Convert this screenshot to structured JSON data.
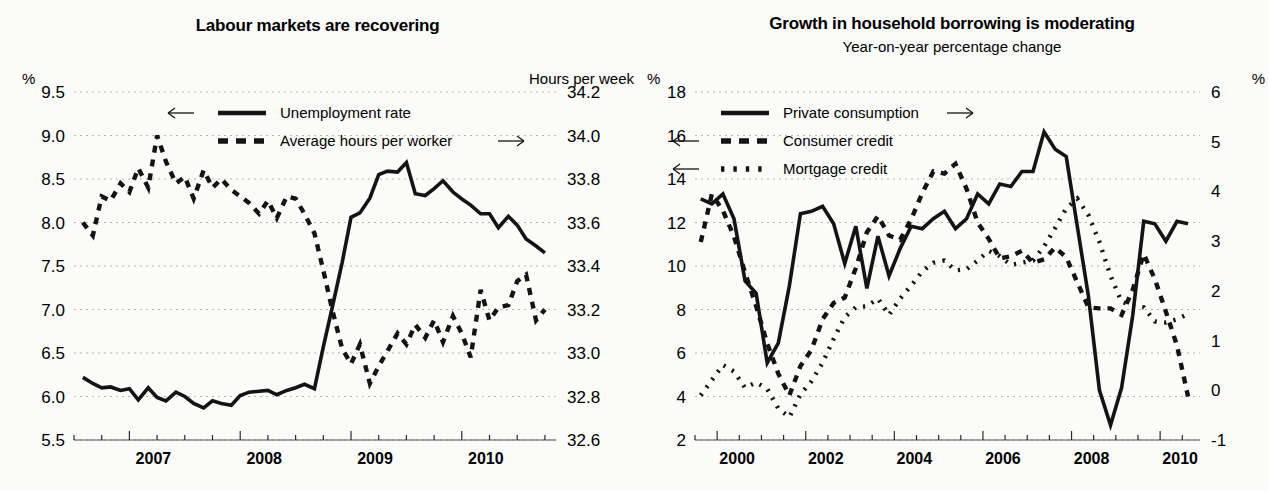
{
  "figure": {
    "background_color": "#fbfbfa",
    "ink_color": "#141414",
    "grid_color": "#b9b2ad"
  },
  "panels": [
    {
      "id": "labour-markets",
      "title": "Labour markets are recovering",
      "subtitle": "",
      "left_axis_unit": "%",
      "right_axis_unit": "Hours per week",
      "legend": [
        {
          "label": "Unemployment rate",
          "style": "solid",
          "arrow": "left"
        },
        {
          "label": "Average hours per worker",
          "style": "dashed",
          "arrow": "right"
        }
      ]
    },
    {
      "id": "household-borrowing",
      "title": "Growth in household borrowing is moderating",
      "subtitle": "Year-on-year percentage change",
      "left_axis_unit": "%",
      "right_axis_unit": "%",
      "legend": [
        {
          "label": "Private consumption",
          "style": "solid",
          "arrow": "right"
        },
        {
          "label": "Consumer credit",
          "style": "dashed",
          "arrow": "left"
        },
        {
          "label": "Mortgage credit",
          "style": "dotted",
          "arrow": "left"
        }
      ]
    }
  ],
  "chart_data": [
    {
      "type": "line",
      "id": "labour-markets",
      "title": "Labour markets are recovering",
      "subtitle": "",
      "xlabel": "",
      "ylabel": "%",
      "y2label": "Hours per week",
      "grid": true,
      "legend_position": "top-center",
      "xlim": [
        2006.5,
        2010.85
      ],
      "xticks_major": [
        2007,
        2008,
        2009,
        2010
      ],
      "xtick_labels": [
        "2007",
        "2008",
        "2009",
        "2010"
      ],
      "xtick_minor_step": 0.25,
      "ylim": [
        5.5,
        9.5
      ],
      "yticks": [
        5.5,
        6.0,
        6.5,
        7.0,
        7.5,
        8.0,
        8.5,
        9.0,
        9.5
      ],
      "ytick_labels": [
        "5.5",
        "6.0",
        "6.5",
        "7.0",
        "7.5",
        "8.0",
        "8.5",
        "9.0",
        "9.5"
      ],
      "y2lim": [
        32.6,
        34.2
      ],
      "y2ticks": [
        32.6,
        32.8,
        33.0,
        33.2,
        33.4,
        33.6,
        33.8,
        34.0,
        34.2
      ],
      "y2tick_labels": [
        "32.6",
        "32.8",
        "33.0",
        "33.2",
        "33.4",
        "33.6",
        "33.8",
        "34.0",
        "34.2"
      ],
      "series": [
        {
          "name": "Unemployment rate",
          "style": "solid",
          "axis": "left",
          "x": [
            2006.58,
            2006.67,
            2006.75,
            2006.83,
            2006.92,
            2007.0,
            2007.08,
            2007.17,
            2007.25,
            2007.33,
            2007.42,
            2007.5,
            2007.58,
            2007.67,
            2007.75,
            2007.83,
            2007.92,
            2008.0,
            2008.08,
            2008.17,
            2008.25,
            2008.33,
            2008.42,
            2008.5,
            2008.58,
            2008.67,
            2008.75,
            2008.83,
            2008.92,
            2009.0,
            2009.08,
            2009.17,
            2009.25,
            2009.33,
            2009.42,
            2009.5,
            2009.58,
            2009.67,
            2009.75,
            2009.83,
            2009.92,
            2010.0,
            2010.08,
            2010.17,
            2010.25,
            2010.33,
            2010.42,
            2010.5,
            2010.58,
            2010.67,
            2010.75
          ],
          "y": [
            6.22,
            6.15,
            6.1,
            6.11,
            6.07,
            6.09,
            5.96,
            6.1,
            5.99,
            5.95,
            6.05,
            6.0,
            5.92,
            5.87,
            5.95,
            5.92,
            5.9,
            6.01,
            6.05,
            6.06,
            6.07,
            6.02,
            6.07,
            6.1,
            6.14,
            6.09,
            6.57,
            7.02,
            7.54,
            8.06,
            8.11,
            8.28,
            8.55,
            8.59,
            8.58,
            8.69,
            8.33,
            8.31,
            8.39,
            8.48,
            8.35,
            8.27,
            8.2,
            8.1,
            8.1,
            7.94,
            8.07,
            7.97,
            7.81,
            7.73,
            7.65,
            7.62
          ]
        },
        {
          "name": "Average hours per worker",
          "style": "dashed",
          "axis": "right",
          "x": [
            2006.58,
            2006.67,
            2006.75,
            2006.83,
            2006.92,
            2007.0,
            2007.08,
            2007.17,
            2007.25,
            2007.33,
            2007.42,
            2007.5,
            2007.58,
            2007.67,
            2007.75,
            2007.83,
            2007.92,
            2008.0,
            2008.08,
            2008.17,
            2008.25,
            2008.33,
            2008.42,
            2008.5,
            2008.58,
            2008.67,
            2008.75,
            2008.83,
            2008.92,
            2009.0,
            2009.08,
            2009.17,
            2009.25,
            2009.33,
            2009.42,
            2009.5,
            2009.58,
            2009.67,
            2009.75,
            2009.83,
            2009.92,
            2010.0,
            2010.08,
            2010.17,
            2010.25,
            2010.33,
            2010.42,
            2010.5,
            2010.58,
            2010.67,
            2010.75
          ],
          "y": [
            33.6,
            33.54,
            33.72,
            33.7,
            33.78,
            33.74,
            33.85,
            33.76,
            34.0,
            33.88,
            33.78,
            33.81,
            33.71,
            33.84,
            33.76,
            33.8,
            33.75,
            33.72,
            33.69,
            33.64,
            33.7,
            33.62,
            33.72,
            33.71,
            33.64,
            33.55,
            33.38,
            33.2,
            33.02,
            32.95,
            33.04,
            32.86,
            32.94,
            33.01,
            33.09,
            33.04,
            33.13,
            33.07,
            33.15,
            33.05,
            33.17,
            33.09,
            32.98,
            33.29,
            33.15,
            33.21,
            33.22,
            33.33,
            33.36,
            33.15,
            33.2,
            33.21
          ]
        }
      ]
    },
    {
      "type": "line",
      "id": "household-borrowing",
      "title": "Growth in household borrowing is moderating",
      "subtitle": "Year-on-year percentage change",
      "xlabel": "",
      "ylabel": "%",
      "y2label": "%",
      "grid": true,
      "legend_position": "top-left",
      "xlim": [
        1999.5,
        2010.9
      ],
      "xticks_major": [
        2000,
        2002,
        2004,
        2006,
        2008,
        2010
      ],
      "xtick_labels": [
        "2000",
        "2002",
        "2004",
        "2006",
        "2008",
        "2010"
      ],
      "xtick_minor_step": 0.5,
      "ylim": [
        2,
        18
      ],
      "yticks": [
        2,
        4,
        6,
        8,
        10,
        12,
        14,
        16,
        18
      ],
      "ytick_labels": [
        "2",
        "4",
        "6",
        "8",
        "10",
        "12",
        "14",
        "16",
        "18"
      ],
      "y2lim": [
        -1,
        6
      ],
      "y2ticks": [
        -1,
        0,
        1,
        2,
        3,
        4,
        5,
        6
      ],
      "y2tick_labels": [
        "-1",
        "0",
        "1",
        "2",
        "3",
        "4",
        "5",
        "6"
      ],
      "series": [
        {
          "name": "Private consumption",
          "style": "solid",
          "axis": "right",
          "x": [
            1999.63,
            1999.88,
            2000.13,
            2000.38,
            2000.63,
            2000.88,
            2001.13,
            2001.38,
            2001.63,
            2001.88,
            2002.13,
            2002.38,
            2002.63,
            2002.88,
            2003.13,
            2003.38,
            2003.63,
            2003.88,
            2004.13,
            2004.38,
            2004.63,
            2004.88,
            2005.13,
            2005.38,
            2005.63,
            2005.88,
            2006.13,
            2006.38,
            2006.63,
            2006.88,
            2007.13,
            2007.38,
            2007.63,
            2007.88,
            2008.13,
            2008.38,
            2008.63,
            2008.88,
            2009.13,
            2009.38,
            2009.63,
            2009.88,
            2010.13,
            2010.38,
            2010.63
          ],
          "y": [
            3.85,
            3.75,
            3.95,
            3.45,
            2.2,
            1.95,
            0.55,
            0.95,
            2.1,
            3.55,
            3.6,
            3.7,
            3.35,
            2.55,
            3.3,
            2.05,
            3.1,
            2.3,
            2.85,
            3.3,
            3.25,
            3.45,
            3.6,
            3.25,
            3.45,
            3.95,
            3.75,
            4.15,
            4.1,
            4.4,
            4.4,
            5.2,
            4.85,
            4.7,
            3.3,
            1.9,
            0.0,
            -0.7,
            0.05,
            1.5,
            3.4,
            3.35,
            3.0,
            3.4,
            3.35
          ]
        },
        {
          "name": "Consumer credit",
          "style": "dashed",
          "axis": "left",
          "x": [
            1999.63,
            1999.88,
            2000.13,
            2000.38,
            2000.63,
            2000.88,
            2001.13,
            2001.38,
            2001.63,
            2001.88,
            2002.13,
            2002.38,
            2002.63,
            2002.88,
            2003.13,
            2003.38,
            2003.63,
            2003.88,
            2004.13,
            2004.38,
            2004.63,
            2004.88,
            2005.13,
            2005.38,
            2005.63,
            2005.88,
            2006.13,
            2006.38,
            2006.63,
            2006.88,
            2007.13,
            2007.38,
            2007.63,
            2007.88,
            2008.13,
            2008.38,
            2008.63,
            2008.88,
            2009.13,
            2009.38,
            2009.63,
            2009.88,
            2010.13,
            2010.38,
            2010.63
          ],
          "y": [
            11.1,
            13.3,
            12.55,
            11.35,
            9.7,
            8.15,
            6.45,
            5.05,
            4.05,
            5.4,
            6.15,
            7.55,
            8.3,
            8.55,
            9.9,
            11.55,
            12.3,
            11.4,
            11.2,
            12.15,
            13.35,
            14.35,
            14.25,
            14.7,
            13.55,
            12.0,
            11.25,
            10.35,
            10.45,
            10.7,
            10.15,
            10.3,
            10.85,
            10.4,
            9.25,
            8.1,
            8.05,
            8.05,
            7.75,
            8.9,
            10.55,
            9.4,
            7.9,
            6.35,
            4.0
          ]
        },
        {
          "name": "Mortgage credit",
          "style": "dotted",
          "axis": "left",
          "x": [
            1999.63,
            1999.88,
            2000.13,
            2000.38,
            2000.63,
            2000.88,
            2001.13,
            2001.38,
            2001.63,
            2001.88,
            2002.13,
            2002.38,
            2002.63,
            2002.88,
            2003.13,
            2003.38,
            2003.63,
            2003.88,
            2004.13,
            2004.38,
            2004.63,
            2004.88,
            2005.13,
            2005.38,
            2005.63,
            2005.88,
            2006.13,
            2006.38,
            2006.63,
            2006.88,
            2007.13,
            2007.38,
            2007.63,
            2007.88,
            2008.13,
            2008.38,
            2008.63,
            2008.88,
            2009.13,
            2009.38,
            2009.63,
            2009.88,
            2010.13,
            2010.38,
            2010.63
          ],
          "y": [
            4.05,
            4.75,
            5.45,
            5.15,
            4.4,
            4.65,
            4.35,
            3.45,
            3.05,
            4.1,
            4.7,
            5.55,
            6.65,
            7.65,
            8.1,
            8.15,
            8.5,
            7.75,
            8.5,
            9.1,
            9.75,
            10.15,
            10.25,
            9.8,
            9.85,
            10.25,
            10.7,
            10.45,
            10.05,
            10.15,
            10.25,
            10.9,
            11.75,
            12.65,
            13.1,
            12.35,
            11.1,
            9.55,
            8.35,
            8.2,
            8.1,
            7.45,
            7.4,
            7.55,
            7.8
          ]
        }
      ]
    }
  ]
}
